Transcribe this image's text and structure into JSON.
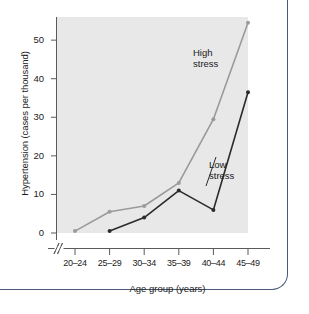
{
  "chart_data": {
    "type": "line",
    "title": "",
    "xlabel": "Age group (years)",
    "ylabel": "Hypertension (cases per thousand)",
    "categories": [
      "20–24",
      "25–29",
      "30–34",
      "35–39",
      "40–44",
      "45–49"
    ],
    "yticks": [
      0,
      10,
      20,
      30,
      40,
      50
    ],
    "ylim": [
      0,
      56
    ],
    "grid": false,
    "legend_position": "inline-annotations",
    "axis_break_x": true,
    "series": [
      {
        "name": "High stress",
        "color": "#9a9a9a",
        "values": [
          0.5,
          5.5,
          7.0,
          13.0,
          29.5,
          54.5
        ]
      },
      {
        "name": "Low stress",
        "color": "#2b2b2b",
        "values": [
          null,
          0.5,
          4.0,
          11.0,
          6.0,
          36.5
        ]
      }
    ],
    "annotations": [
      {
        "text_line1": "High",
        "text_line2": "stress",
        "series": "High stress"
      },
      {
        "text_line1": "Low",
        "text_line2": "stress",
        "series": "Low stress"
      }
    ],
    "plot_background": "#e8e8e8",
    "axis_color": "#5a5a5a"
  }
}
